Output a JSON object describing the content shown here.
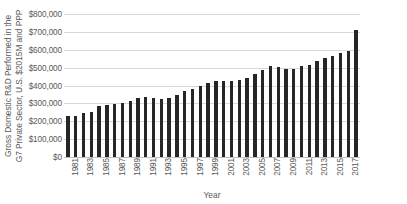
{
  "chart_data": {
    "type": "bar",
    "title": "",
    "xlabel": "Year",
    "ylabel_lines": [
      "Gross Domestic R&D Performed in the",
      "G7 Private Sector, U.S. $2015M and PPP"
    ],
    "ylabel": "Gross Domestic R&D Performed in the G7 Private Sector, U.S. $2015M and PPP",
    "grid": true,
    "legend": "none",
    "ylim": [
      0,
      800000
    ],
    "ytick_values": [
      0,
      100000,
      200000,
      300000,
      400000,
      500000,
      600000,
      700000,
      800000
    ],
    "ytick_labels": [
      "$0",
      "$100,000",
      "$200,000",
      "$300,000",
      "$400,000",
      "$500,000",
      "$600,000",
      "$700,000",
      "$800,000"
    ],
    "xtick_labels": [
      "1981",
      "1983",
      "1985",
      "1987",
      "1989",
      "1991",
      "1993",
      "1995",
      "1997",
      "1999",
      "2001",
      "2003",
      "2005",
      "2007",
      "2009",
      "2011",
      "2013",
      "2015",
      "2017"
    ],
    "bar_color": "#262626",
    "grid_color": "#d9d9d9",
    "categories": [
      "1981",
      "1982",
      "1983",
      "1984",
      "1985",
      "1986",
      "1987",
      "1988",
      "1989",
      "1990",
      "1991",
      "1992",
      "1993",
      "1994",
      "1995",
      "1996",
      "1997",
      "1998",
      "1999",
      "2000",
      "2001",
      "2002",
      "2003",
      "2004",
      "2005",
      "2006",
      "2007",
      "2008",
      "2009",
      "2010",
      "2011",
      "2012",
      "2013",
      "2014",
      "2015",
      "2016",
      "2017",
      "2018"
    ],
    "values": [
      232000,
      230000,
      247000,
      253000,
      285000,
      291000,
      297000,
      304000,
      312000,
      332000,
      337000,
      330000,
      327000,
      330000,
      345000,
      369000,
      378000,
      398000,
      414000,
      428000,
      425000,
      428000,
      430000,
      442000,
      465000,
      487000,
      508000,
      503000,
      493000,
      493000,
      510000,
      513000,
      537000,
      555000,
      565000,
      583000,
      595000,
      712000
    ]
  }
}
